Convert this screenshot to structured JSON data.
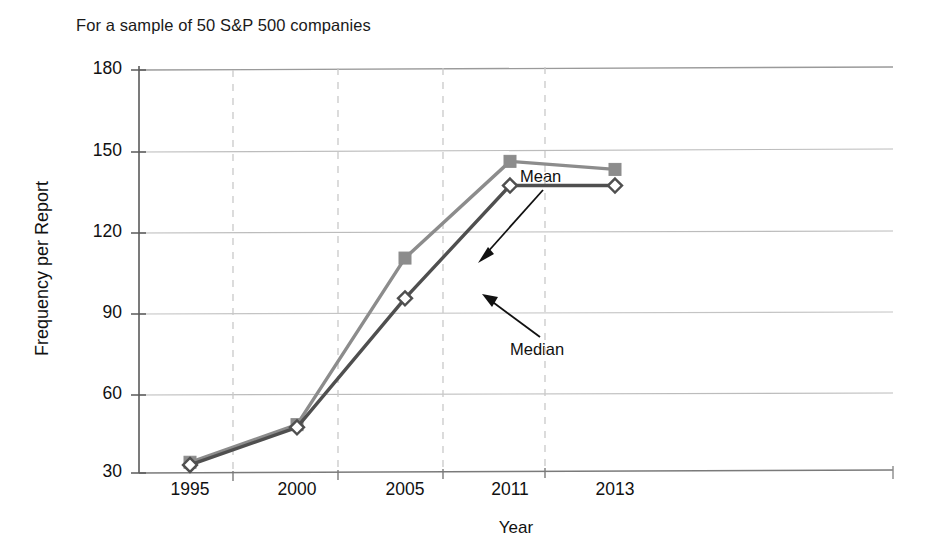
{
  "chart_data": {
    "type": "line",
    "title": "",
    "subtitle": "For a sample of 50 S&P 500 companies",
    "xlabel": "Year",
    "ylabel": "Frequency per Report",
    "categories": [
      "1995",
      "2000",
      "2005",
      "2011",
      "2013"
    ],
    "series": [
      {
        "name": "Mean",
        "values": [
          34,
          48,
          110,
          146,
          143
        ],
        "color": "#8c8c8c",
        "marker": "square"
      },
      {
        "name": "Median",
        "values": [
          33,
          47,
          95,
          137,
          137
        ],
        "color": "#4f4f4f",
        "marker": "diamond"
      }
    ],
    "yticks": [
      30,
      60,
      90,
      120,
      150,
      180
    ],
    "ylim": [
      30,
      180
    ],
    "xticks": [
      "1995",
      "2000",
      "2005",
      "2011",
      "2013"
    ],
    "grid": {
      "horizontal": true,
      "vertical_dashed": true
    },
    "legend": "none",
    "annotations": [
      {
        "text": "Mean",
        "points_to": "2005 Mean data point"
      },
      {
        "text": "Median",
        "points_to": "2005 Median data point"
      }
    ]
  },
  "axis": {
    "y_tick_labels": [
      "180",
      "150",
      "120",
      "90",
      "60",
      "30"
    ],
    "x_tick_labels": [
      "1995",
      "2000",
      "2005",
      "2011",
      "2013"
    ],
    "x_title": "Year",
    "y_title": "Frequency per Report"
  },
  "annotations": {
    "mean_label": "Mean",
    "median_label": "Median"
  },
  "subtitle": "For a sample of 50 S&P 500 companies",
  "colors": {
    "mean_line": "#8c8c8c",
    "median_line": "#4f4f4f",
    "axis": "#555555",
    "grid": "#b8b8b8",
    "grid_dashed": "#c9c9c9",
    "text": "#111111"
  }
}
